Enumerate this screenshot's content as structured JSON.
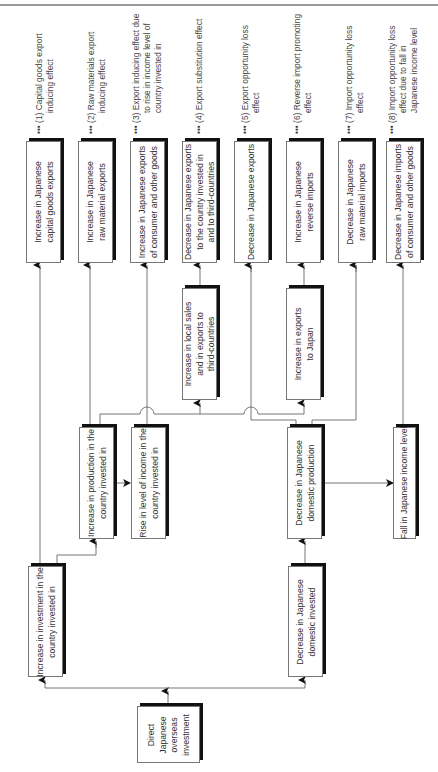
{
  "effects": [
    {
      "label": "••• (1) Capital goods export\n         inducing effect"
    },
    {
      "label": "••• (2) Raw materials export\n         inducing effect"
    },
    {
      "label": "••• (3) Export inducing effect due\n         to rise in income level of\n         country invested in"
    },
    {
      "label": "••• (4) Export substitution effect"
    },
    {
      "label": "••• (5) Export opportunity loss\n         effect"
    },
    {
      "label": "••• (6) Reverse import promoting\n         effect"
    },
    {
      "label": "••• (7) Import opportunity loss\n         effect"
    },
    {
      "label": "••• (8) Import opportunity loss\n         effect due to fall in\n         Japanese income level"
    }
  ],
  "outcomes": [
    {
      "text": "Increase in Japanese\ncapital goods exports"
    },
    {
      "text": "Increase in Japanese\nraw material exports"
    },
    {
      "text": "Increase in Japanese exports\nof consumer and other goods"
    },
    {
      "text": "Decrease in Japanese exports\nto the country invested in\nand to third-countries"
    },
    {
      "text": "Decrease in Japanese exports"
    },
    {
      "text": "Increase in Japanese\nreverse imports"
    },
    {
      "text": "Decrease in Japanese\nraw material imports"
    },
    {
      "text": "Decrease in Japanese imports\nof consumer and other goods"
    }
  ],
  "intermediate": {
    "local_sales": "Increase in local sales\nand in exports to\nthird-countries",
    "exports_japan": "Increase in exports\nto Japan",
    "production": "Increase in production in the\ncountry invested in",
    "income_rise": "Rise in level of income in the\ncountry invested in",
    "domestic_production": "Decrease in Japanese\ndomestic production",
    "income_fall": "Fall in Japanese income level",
    "investment_increase": "Increase in investment in the\ncountry invested in",
    "domestic_invested": "Decrease in Japanese\ndomestic invested",
    "root": "Direct\nJapanese\noverseas\ninvestment"
  }
}
